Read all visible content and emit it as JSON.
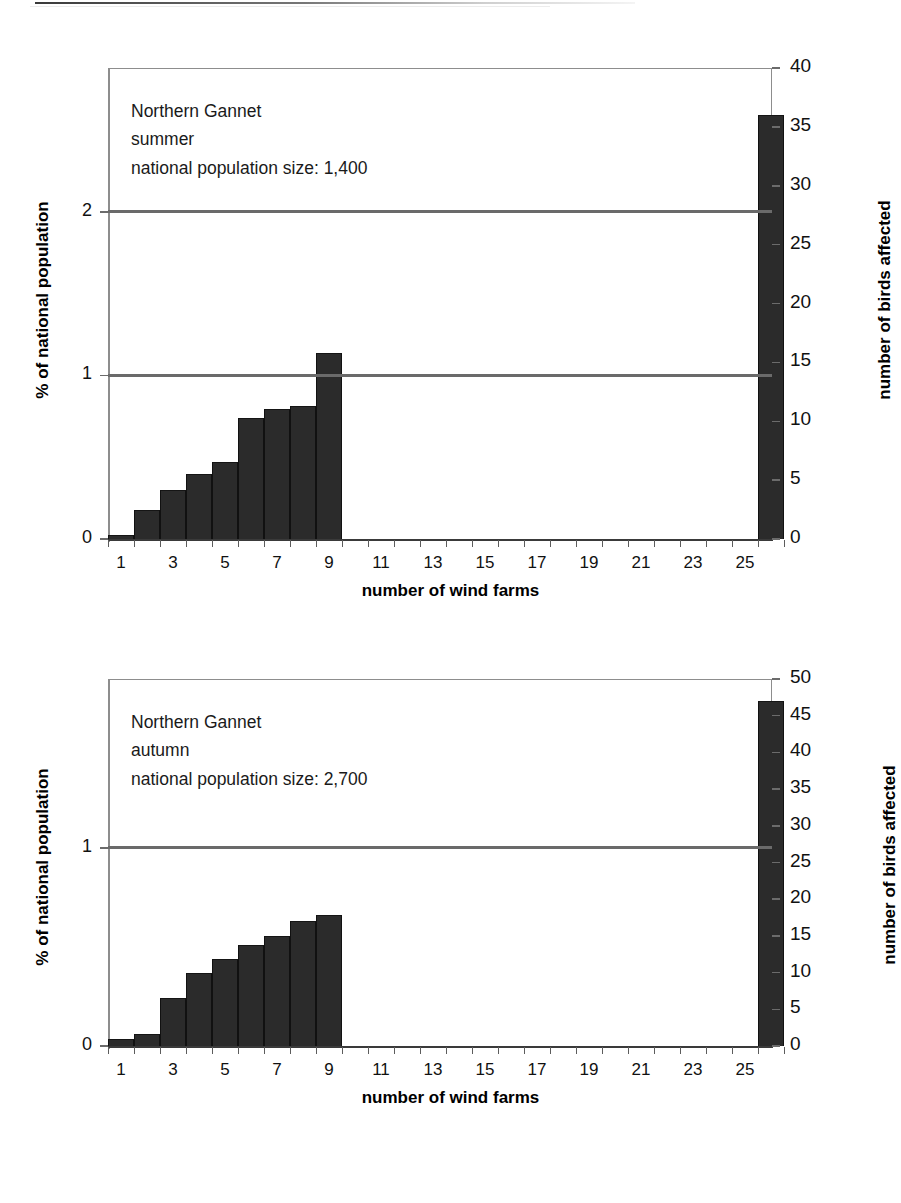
{
  "charts": [
    {
      "id": "summer",
      "annotation": {
        "species": "Northern Gannet",
        "season": "summer",
        "population": "national population size: 1,400"
      },
      "left_axis": {
        "title": "% of national population",
        "ticks": [
          "0",
          "1",
          "2"
        ],
        "min": 0,
        "max": 2.88
      },
      "right_axis": {
        "title": "number of birds affected",
        "ticks": [
          "0",
          "5",
          "10",
          "15",
          "20",
          "25",
          "30",
          "35",
          "40"
        ],
        "min": 0,
        "max": 40
      },
      "x_axis": {
        "title": "number of wind farms",
        "ticks": [
          "1",
          "3",
          "5",
          "7",
          "9",
          "11",
          "13",
          "15",
          "17",
          "19",
          "21",
          "23",
          "25"
        ]
      },
      "reference_lines": [
        {
          "label": "1",
          "value": 1
        },
        {
          "label": "2",
          "value": 2
        }
      ]
    },
    {
      "id": "autumn",
      "annotation": {
        "species": "Northern Gannet",
        "season": "autumn",
        "population": "national population size: 2,700"
      },
      "left_axis": {
        "title": "% of national population",
        "ticks": [
          "0",
          "1"
        ],
        "min": 0,
        "max": 1.852
      },
      "right_axis": {
        "title": "number of birds affected",
        "ticks": [
          "0",
          "5",
          "10",
          "15",
          "20",
          "25",
          "30",
          "35",
          "40",
          "45",
          "50"
        ],
        "min": 0,
        "max": 50
      },
      "x_axis": {
        "title": "number of wind farms",
        "ticks": [
          "1",
          "3",
          "5",
          "7",
          "9",
          "11",
          "13",
          "15",
          "17",
          "19",
          "21",
          "23",
          "25"
        ]
      },
      "reference_lines": [
        {
          "label": "1",
          "value": 1
        }
      ]
    }
  ],
  "chart_data": [
    {
      "type": "bar",
      "title": "Northern Gannet summer",
      "subtitle": "national population size: 1,400",
      "xlabel": "number of wind farms",
      "ylabel": "% of national population",
      "y2label": "number of birds affected",
      "categories": [
        1,
        2,
        3,
        4,
        5,
        6,
        7,
        8,
        9,
        10,
        11,
        12,
        13,
        14,
        15,
        16,
        17,
        18,
        19,
        20,
        21,
        22,
        23,
        24,
        25,
        26
      ],
      "values_birds": [
        0.3,
        2.5,
        4.2,
        5.5,
        6.5,
        10.3,
        11.0,
        11.3,
        15.8,
        0,
        0,
        0,
        0,
        0,
        0,
        0,
        0,
        0,
        0,
        0,
        0,
        0,
        0,
        0,
        0,
        36.0
      ],
      "values_percent": [
        0.02,
        0.18,
        0.3,
        0.39,
        0.46,
        0.74,
        0.79,
        0.81,
        1.13,
        0,
        0,
        0,
        0,
        0,
        0,
        0,
        0,
        0,
        0,
        0,
        0,
        0,
        0,
        0,
        0,
        2.57
      ],
      "ylim": [
        0,
        2.88
      ],
      "y2lim": [
        0,
        40
      ],
      "xticks": [
        1,
        3,
        5,
        7,
        9,
        11,
        13,
        15,
        17,
        19,
        21,
        23,
        25
      ],
      "reference_lines": [
        1,
        2
      ],
      "grid": false,
      "legend": "none"
    },
    {
      "type": "bar",
      "title": "Northern Gannet autumn",
      "subtitle": "national population size: 2,700",
      "xlabel": "number of wind farms",
      "ylabel": "% of national population",
      "y2label": "number of birds affected",
      "categories": [
        1,
        2,
        3,
        4,
        5,
        6,
        7,
        8,
        9,
        10,
        11,
        12,
        13,
        14,
        15,
        16,
        17,
        18,
        19,
        20,
        21,
        22,
        23,
        24,
        25,
        26
      ],
      "values_birds": [
        1.0,
        1.6,
        6.6,
        10.0,
        11.9,
        13.7,
        15.0,
        17.0,
        17.8,
        0,
        0,
        0,
        0,
        0,
        0,
        0,
        0,
        0,
        0,
        0,
        0,
        0,
        0,
        0,
        0,
        47.0
      ],
      "values_percent": [
        0.04,
        0.06,
        0.24,
        0.37,
        0.44,
        0.51,
        0.56,
        0.63,
        0.66,
        0,
        0,
        0,
        0,
        0,
        0,
        0,
        0,
        0,
        0,
        0,
        0,
        0,
        0,
        0,
        0,
        1.74
      ],
      "ylim": [
        0,
        1.852
      ],
      "y2lim": [
        0,
        50
      ],
      "xticks": [
        1,
        3,
        5,
        7,
        9,
        11,
        13,
        15,
        17,
        19,
        21,
        23,
        25
      ],
      "reference_lines": [
        1
      ],
      "grid": false,
      "legend": "none"
    }
  ]
}
